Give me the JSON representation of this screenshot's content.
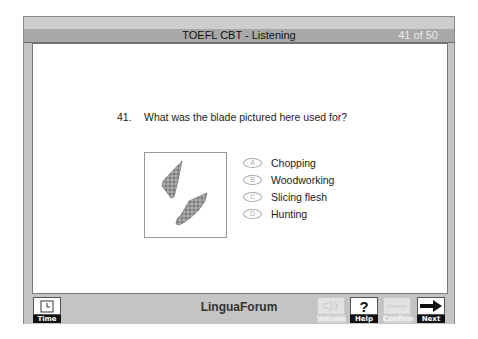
{
  "header": {
    "title": "TOEFL CBT - Listening",
    "progress": "41 of 50"
  },
  "question": {
    "number": "41.",
    "text": "What was the blade pictured here used for?",
    "image_alt": "two stone blades"
  },
  "options": [
    {
      "letter": "A",
      "label": "Chopping"
    },
    {
      "letter": "B",
      "label": "Woodworking"
    },
    {
      "letter": "C",
      "label": "Slicing flesh"
    },
    {
      "letter": "D",
      "label": "Hunting"
    }
  ],
  "footer": {
    "brand": "LinguaForum",
    "buttons": {
      "time": "Time",
      "volume": "Volume",
      "help": "Help",
      "answer_top": "Answer",
      "confirm": "Confirm",
      "next": "Next"
    }
  }
}
